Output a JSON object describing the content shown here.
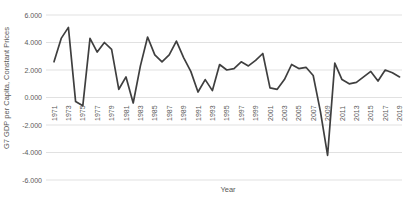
{
  "chart_data": {
    "type": "line",
    "title": "",
    "xlabel": "Year",
    "ylabel": "G7 GDP per Capita, Constant Prices",
    "x": [
      1971,
      1972,
      1973,
      1974,
      1975,
      1976,
      1977,
      1978,
      1979,
      1980,
      1981,
      1982,
      1983,
      1984,
      1985,
      1986,
      1987,
      1988,
      1989,
      1990,
      1991,
      1992,
      1993,
      1994,
      1995,
      1996,
      1997,
      1998,
      1999,
      2000,
      2001,
      2002,
      2003,
      2004,
      2005,
      2006,
      2007,
      2008,
      2009,
      2010,
      2011,
      2012,
      2013,
      2014,
      2015,
      2016,
      2017,
      2018,
      2019
    ],
    "values": [
      2.6,
      4.3,
      5.1,
      -0.3,
      -0.6,
      4.3,
      3.3,
      4.0,
      3.5,
      0.6,
      1.5,
      -0.4,
      2.3,
      4.4,
      3.1,
      2.6,
      3.1,
      4.1,
      2.9,
      1.9,
      0.4,
      1.3,
      0.5,
      2.4,
      2.0,
      2.1,
      2.6,
      2.3,
      2.7,
      3.2,
      0.7,
      0.6,
      1.3,
      2.4,
      2.1,
      2.2,
      1.6,
      -1.0,
      -4.2,
      2.5,
      1.3,
      1.0,
      1.1,
      1.5,
      1.9,
      1.2,
      2.0,
      1.8,
      1.5
    ],
    "ylim": [
      -6,
      6
    ],
    "ytick_labels": [
      "6.000",
      "4.000",
      "2.000",
      "0.000",
      "-2.000",
      "-4.000",
      "-6.000"
    ],
    "ytick_values": [
      6,
      4,
      2,
      0,
      -2,
      -4,
      -6
    ],
    "xtick_years": [
      1971,
      1973,
      1975,
      1977,
      1979,
      1981,
      1983,
      1985,
      1987,
      1989,
      1991,
      1993,
      1995,
      1997,
      1999,
      2001,
      2003,
      2005,
      2007,
      2009,
      2011,
      2013,
      2015,
      2017,
      2019
    ],
    "grid": "horizontal",
    "legend_position": "none",
    "line_color": "#3f3f3f",
    "gridline_color": "#d9d9d9",
    "label_color": "#595959"
  }
}
